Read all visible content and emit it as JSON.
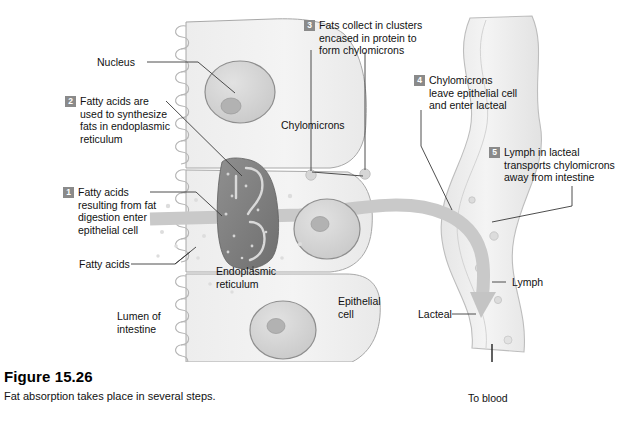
{
  "figure": {
    "number": "Figure 15.26",
    "caption": "Fat absorption takes place in several steps."
  },
  "steps": [
    {
      "n": "1",
      "text": "Fatty acids\nresulting from fat\ndigestion enter\nepithelial cell"
    },
    {
      "n": "2",
      "text": "Fatty acids are\nused to synthesize\nfats in endoplasmic\nreticulum"
    },
    {
      "n": "3",
      "text": "Fats collect in clusters\nencased in protein to\nform chylomicrons"
    },
    {
      "n": "4",
      "text": "Chylomicrons\nleave epithelial cell\nand enter lacteal"
    },
    {
      "n": "5",
      "text": "Lymph in lacteal\ntransports chylomicrons\naway from intestine"
    }
  ],
  "labels": {
    "nucleus": "Nucleus",
    "chylomicrons": "Chylomicrons",
    "fatty_acids": "Fatty acids",
    "endoplasmic_reticulum": "Endoplasmic\nreticulum",
    "lumen_of_intestine": "Lumen of\nintestine",
    "epithelial_cell": "Epithelial\ncell",
    "lacteal": "Lacteal",
    "lymph": "Lymph",
    "to_blood": "To blood"
  },
  "colors": {
    "badge_bg": "#8a8a8a",
    "badge_text": "#ffffff",
    "text": "#111111",
    "leader_line": "#3a3a3a",
    "cell_fill": "#f2f2f2",
    "cell_outline": "#a8a8a8",
    "nucleus_fill": "#d8d8d8",
    "nucleus_outline": "#8e8e8e",
    "nucleolus_fill": "#b4b4b4",
    "er_fill": "#8d8d8d",
    "er_dark": "#6e6e6e",
    "flow_band": "#c9c9c9",
    "lacteal_fill": "#ededed",
    "microvilli": "#b9b9b9",
    "background": "#ffffff"
  }
}
